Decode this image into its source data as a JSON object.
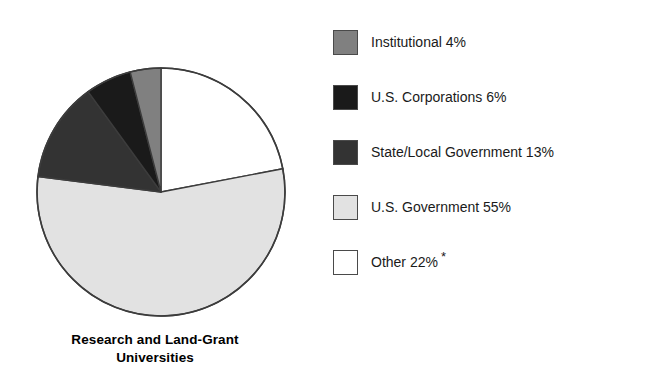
{
  "chart_data": {
    "type": "pie",
    "title": "",
    "subtitle": "",
    "xlabel": "",
    "ylabel": "",
    "caption_lines": [
      "Research and Land-Grant",
      "Universities"
    ],
    "legend_position": "right",
    "grid": false,
    "start_angle_deg": 0,
    "direction": "clockwise",
    "units": "percent",
    "footnote_marker": "*",
    "categories": [
      "Other",
      "U.S. Government",
      "State/Local Government",
      "U.S. Corporations",
      "Institutional"
    ],
    "values": [
      22,
      55,
      13,
      6,
      4
    ],
    "slices": [
      {
        "label": "Other",
        "value": 22,
        "value_text": "22%",
        "color": "#ffffff",
        "note": "*"
      },
      {
        "label": "U.S. Government",
        "value": 55,
        "value_text": "55%",
        "color": "#e2e2e2",
        "note": ""
      },
      {
        "label": "State/Local Government",
        "value": 13,
        "value_text": "13%",
        "color": "#333333",
        "note": ""
      },
      {
        "label": "U.S. Corporations",
        "value": 6,
        "value_text": "6%",
        "color": "#1a1a1a",
        "note": ""
      },
      {
        "label": "Institutional",
        "value": 4,
        "value_text": "4%",
        "color": "#808080",
        "note": ""
      }
    ],
    "legend_entries": [
      {
        "label": "Institutional 4%",
        "color": "#808080",
        "asterisk": ""
      },
      {
        "label": "U.S. Corporations 6%",
        "color": "#1a1a1a",
        "asterisk": ""
      },
      {
        "label": "State/Local Government 13%",
        "color": "#333333",
        "asterisk": ""
      },
      {
        "label": "U.S. Government 55%",
        "color": "#e2e2e2",
        "asterisk": ""
      },
      {
        "label": "Other 22%",
        "color": "#ffffff",
        "asterisk": "*"
      }
    ]
  },
  "pie": {
    "caption_line1": "Research and Land-Grant",
    "caption_line2": "Universities",
    "outline_color": "#3c3c3c"
  },
  "legend": {
    "items": [
      {
        "label": "Institutional 4%",
        "asterisk": ""
      },
      {
        "label": "U.S. Corporations 6%",
        "asterisk": ""
      },
      {
        "label": "State/Local Government 13%",
        "asterisk": ""
      },
      {
        "label": "U.S. Government 55%",
        "asterisk": ""
      },
      {
        "label": "Other 22%",
        "asterisk": "*"
      }
    ]
  }
}
